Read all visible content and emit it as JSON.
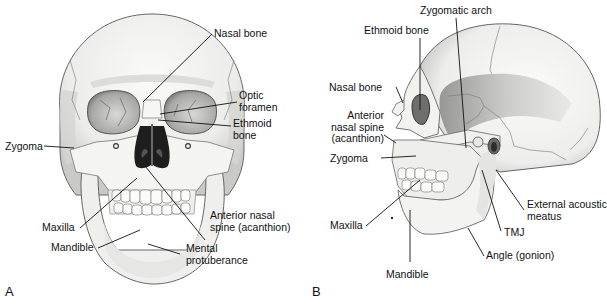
{
  "figure": {
    "panels": [
      {
        "id": "A",
        "letter": "A",
        "view": "Anterior (frontal) view of skull",
        "labels": {
          "nasal_bone": "Nasal bone",
          "optic_foramen_1": "Optic",
          "optic_foramen_2": "foramen",
          "ethmoid_bone_1": "Ethmoid",
          "ethmoid_bone_2": "bone",
          "zygoma": "Zygoma",
          "maxilla": "Maxilla",
          "mandible": "Mandible",
          "anterior_nasal_spine_1": "Anterior nasal",
          "anterior_nasal_spine_2": "spine (acanthion)",
          "mental_protuberance_1": "Mental",
          "mental_protuberance_2": "protuberance"
        }
      },
      {
        "id": "B",
        "letter": "B",
        "view": "Lateral view of skull",
        "labels": {
          "zygomatic_arch": "Zygomatic arch",
          "ethmoid_bone": "Ethmoid bone",
          "nasal_bone": "Nasal bone",
          "anterior_nasal_spine_1": "Anterior",
          "anterior_nasal_spine_2": "nasal spine",
          "anterior_nasal_spine_3": "(acanthion)",
          "zygoma": "Zygoma",
          "maxilla": "Maxilla",
          "mandible": "Mandible",
          "tmj": "TMJ",
          "angle": "Angle (gonion)",
          "external_acoustic_meatus_1": "External acoustic",
          "external_acoustic_meatus_2": "meatus"
        }
      }
    ],
    "colors": {
      "bone": "#f2f2f0",
      "shade": "#b8b8b6",
      "dark": "#2a2a2a",
      "outline": "#555555",
      "leader": "#111111"
    }
  }
}
